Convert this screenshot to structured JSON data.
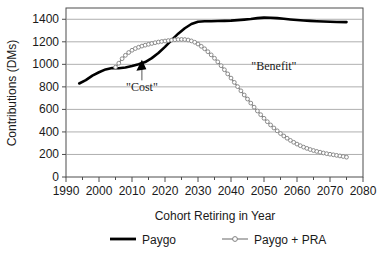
{
  "chart_data": {
    "type": "line",
    "title": "",
    "xlabel": "Cohort Retiring in Year",
    "ylabel": "Contributions (DMs)",
    "xlim": [
      1990,
      2080
    ],
    "ylim": [
      0,
      1500
    ],
    "xticks": [
      1990,
      2000,
      2010,
      2020,
      2030,
      2040,
      2050,
      2060,
      2070,
      2080
    ],
    "xtick_labels": [
      "1990",
      "2000",
      "2010",
      "2020",
      "2030",
      "2040",
      "2050",
      "2060",
      "2070",
      "2080"
    ],
    "minor_xtick_step": 5,
    "yticks": [
      0,
      200,
      400,
      600,
      800,
      1000,
      1200,
      1400
    ],
    "ytick_labels": [
      "0",
      "200",
      "400",
      "600",
      "800",
      "1000",
      "1200",
      "1400"
    ],
    "grid": "horizontal",
    "legend_position": "below",
    "series": [
      {
        "name": "Paygo",
        "color": "#000000",
        "style": "solid-thick",
        "marker": "none",
        "x": [
          1994,
          1996,
          1998,
          2000,
          2002,
          2004,
          2006,
          2008,
          2010,
          2012,
          2014,
          2016,
          2018,
          2020,
          2022,
          2024,
          2026,
          2028,
          2030,
          2032,
          2034,
          2036,
          2038,
          2040,
          2042,
          2044,
          2046,
          2048,
          2050,
          2052,
          2054,
          2056,
          2058,
          2060,
          2062,
          2064,
          2066,
          2068,
          2070,
          2072,
          2075
        ],
        "y": [
          830,
          860,
          900,
          930,
          955,
          968,
          965,
          972,
          985,
          1000,
          1020,
          1055,
          1100,
          1155,
          1215,
          1272,
          1320,
          1358,
          1378,
          1383,
          1383,
          1384,
          1386,
          1388,
          1392,
          1397,
          1402,
          1410,
          1415,
          1414,
          1410,
          1404,
          1398,
          1393,
          1389,
          1386,
          1383,
          1380,
          1378,
          1376,
          1375
        ]
      },
      {
        "name": "Paygo + PRA",
        "color": "#808080",
        "style": "solid-marker",
        "marker": "open-circle",
        "x": [
          2005,
          2006,
          2007,
          2008,
          2009,
          2010,
          2011,
          2012,
          2013,
          2014,
          2015,
          2016,
          2017,
          2018,
          2019,
          2020,
          2021,
          2022,
          2023,
          2024,
          2025,
          2026,
          2027,
          2028,
          2029,
          2030,
          2031,
          2032,
          2033,
          2034,
          2035,
          2036,
          2037,
          2038,
          2039,
          2040,
          2041,
          2042,
          2043,
          2044,
          2045,
          2046,
          2047,
          2048,
          2049,
          2050,
          2051,
          2052,
          2053,
          2054,
          2055,
          2056,
          2057,
          2058,
          2059,
          2060,
          2061,
          2062,
          2063,
          2064,
          2065,
          2066,
          2067,
          2068,
          2069,
          2070,
          2071,
          2072,
          2073,
          2074,
          2075
        ],
        "y": [
          975,
          1010,
          1050,
          1080,
          1105,
          1125,
          1140,
          1152,
          1162,
          1170,
          1178,
          1185,
          1192,
          1198,
          1203,
          1207,
          1211,
          1215,
          1218,
          1220,
          1221,
          1220,
          1216,
          1208,
          1196,
          1180,
          1160,
          1138,
          1112,
          1084,
          1054,
          1022,
          988,
          952,
          915,
          878,
          840,
          802,
          765,
          728,
          692,
          656,
          620,
          586,
          553,
          521,
          491,
          462,
          435,
          410,
          386,
          364,
          344,
          325,
          308,
          292,
          278,
          265,
          254,
          244,
          235,
          227,
          220,
          213,
          207,
          202,
          197,
          192,
          187,
          182,
          176
        ]
      }
    ],
    "annotations": [
      {
        "text": "\"Cost\"",
        "x": 2013,
        "y": 760,
        "arrow_to_x": 2013,
        "arrow_to_y": 1040
      },
      {
        "text": "\"Benefit\"",
        "x": 2053,
        "y": 950,
        "arrow_to_x": null,
        "arrow_to_y": null
      }
    ]
  },
  "legend": {
    "items": [
      {
        "label": "Paygo",
        "color": "#000000"
      },
      {
        "label": "Paygo + PRA",
        "color": "#808080"
      }
    ]
  }
}
